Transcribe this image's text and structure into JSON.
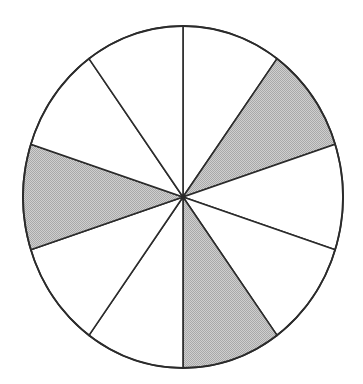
{
  "figure": {
    "title": "",
    "caption": "",
    "type": "fraction-circle-diagram",
    "background_color": "#ffffff"
  },
  "chart_data": {
    "type": "pie",
    "title": "",
    "subtitle": "",
    "xlabel": "",
    "ylabel": "",
    "legend": [],
    "annotations": [],
    "grid": false,
    "total_sectors": 10,
    "sector_angle_degrees": 36,
    "shaded_count": 3,
    "unshaded_count": 7,
    "fraction_shaded": "3/10",
    "start_angle_degrees": 0,
    "categories": [
      "sector-1",
      "sector-2",
      "sector-3",
      "sector-4",
      "sector-5",
      "sector-6",
      "sector-7",
      "sector-8",
      "sector-9",
      "sector-10"
    ],
    "values": [
      36,
      36,
      36,
      36,
      36,
      36,
      36,
      36,
      36,
      36
    ],
    "series": [
      {
        "name": "sectors",
        "values": [
          36,
          36,
          36,
          36,
          36,
          36,
          36,
          36,
          36,
          36
        ]
      }
    ],
    "sectors": [
      {
        "index": 1,
        "start_deg": 0,
        "end_deg": 36,
        "shaded": false,
        "fill": "#ffffff"
      },
      {
        "index": 2,
        "start_deg": 36,
        "end_deg": 72,
        "shaded": true,
        "fill": "#c3c3c3"
      },
      {
        "index": 3,
        "start_deg": 72,
        "end_deg": 108,
        "shaded": false,
        "fill": "#ffffff"
      },
      {
        "index": 4,
        "start_deg": 108,
        "end_deg": 144,
        "shaded": false,
        "fill": "#ffffff"
      },
      {
        "index": 5,
        "start_deg": 144,
        "end_deg": 180,
        "shaded": true,
        "fill": "#c3c3c3"
      },
      {
        "index": 6,
        "start_deg": 180,
        "end_deg": 216,
        "shaded": false,
        "fill": "#ffffff"
      },
      {
        "index": 7,
        "start_deg": 216,
        "end_deg": 252,
        "shaded": false,
        "fill": "#ffffff"
      },
      {
        "index": 8,
        "start_deg": 252,
        "end_deg": 288,
        "shaded": true,
        "fill": "#c3c3c3"
      },
      {
        "index": 9,
        "start_deg": 288,
        "end_deg": 324,
        "shaded": false,
        "fill": "#ffffff"
      },
      {
        "index": 10,
        "start_deg": 324,
        "end_deg": 360,
        "shaded": false,
        "fill": "#ffffff"
      }
    ],
    "geometry": {
      "center_x": 183,
      "center_y": 197,
      "radius_x": 160,
      "radius_y": 171
    },
    "colors": {
      "shaded_fill": "#c3c3c3",
      "unshaded_fill": "#ffffff",
      "stroke": "#2b2b2b",
      "background": "#ffffff"
    }
  }
}
